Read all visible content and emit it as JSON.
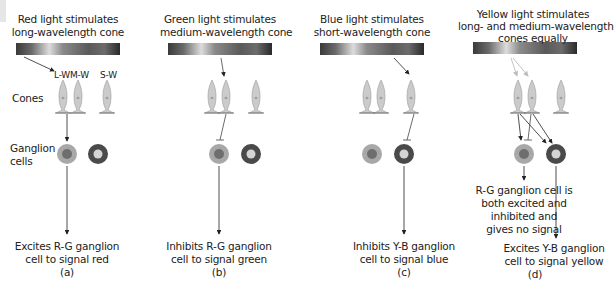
{
  "figure": {
    "row_labels": {
      "cones": "Cones",
      "ganglion_line1": "Ganglion",
      "ganglion_line2": "cells"
    },
    "cone_labels": [
      "L-W",
      "M-W",
      "S-W"
    ],
    "panels": [
      {
        "id": "a",
        "label": "(a)",
        "title_lines": [
          "Red light stimulates",
          "long-wavelength cone"
        ],
        "caption_lines": [
          "Excites R-G ganglion",
          "cell to signal red"
        ]
      },
      {
        "id": "b",
        "label": "(b)",
        "title_lines": [
          "Green light stimulates",
          "medium-wavelength cone"
        ],
        "caption_lines": [
          "Inhibits R-G ganglion",
          "cell to signal green"
        ]
      },
      {
        "id": "c",
        "label": "(c)",
        "title_lines": [
          "Blue light stimulates",
          "short-wavelength cone"
        ],
        "caption_lines": [
          "Inhibits Y-B ganglion",
          "cell to signal blue"
        ]
      },
      {
        "id": "d",
        "label": "(d)",
        "title_lines": [
          "Yellow light stimulates",
          "long- and medium-wavelength",
          "cones equally"
        ],
        "caption_lines": [
          "Excites Y-B ganglion",
          "cell to signal yellow"
        ],
        "note_lines": [
          "R-G ganglion cell is",
          "both excited and",
          "inhibited and",
          "gives no signal"
        ]
      }
    ],
    "colors": {
      "rg_cell_outer": "#a8a8a8",
      "rg_cell_inner": "#6e6e6e",
      "yb_cell_outer": "#4a4a4a",
      "yb_cell_inner": "#d4d4d4",
      "cone_fill": "#c9c9c9",
      "arrow": "#222222",
      "yellow_arrow": "#bdbdbd"
    }
  }
}
